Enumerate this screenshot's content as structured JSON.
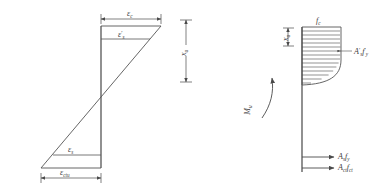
{
  "figure": {
    "type": "engineering-section-diagram",
    "stroke_color": "#4a4a4a",
    "text_color": "#3a3a3a",
    "background": "#ffffff"
  },
  "strain_diagram": {
    "name": "strain-distribution",
    "labels": {
      "top_dimension": "ε",
      "top_dimension_sub": "c",
      "compression_steel": "ε",
      "compression_steel_prime": "′",
      "compression_steel_sub": "s",
      "tension_steel": "ε",
      "tension_steel_sub": "s",
      "bottom_dimension": "ε",
      "bottom_dimension_sub": "ctu",
      "neutral_axis_depth": "x",
      "neutral_axis_depth_sub": "u"
    }
  },
  "stress_diagram": {
    "name": "stress-force-distribution",
    "labels": {
      "concrete_stress": "f",
      "concrete_stress_sub": "c",
      "block_depth": "x",
      "block_depth_sub": "u",
      "compression_force": "A′ f′",
      "compression_force_main": "A",
      "compression_force_prime1": "′",
      "compression_force_sub1": "s",
      "compression_force_f": "f",
      "compression_force_prime2": "′",
      "compression_force_sub2": "y",
      "moment": "M",
      "moment_sub": "u",
      "tension_force_steel": "A",
      "tension_force_steel_sub": "s",
      "tension_force_steel_f": "f",
      "tension_force_steel_fsub": "y",
      "tension_force_concrete": "A",
      "tension_force_concrete_sub": "ct",
      "tension_force_concrete_f": "f",
      "tension_force_concrete_fsub": "ct"
    }
  }
}
